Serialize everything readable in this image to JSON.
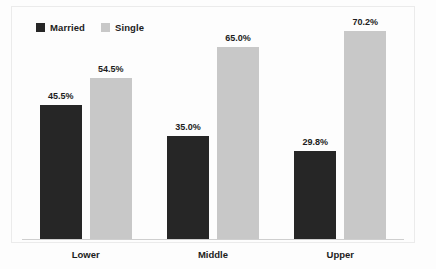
{
  "chart_data": {
    "type": "bar",
    "title": "",
    "subtitle": "",
    "xlabel": "",
    "ylabel": "",
    "categories": [
      "Lower",
      "Middle",
      "Upper"
    ],
    "series": [
      {
        "name": "Married",
        "color": "#262626",
        "values": [
          45.5,
          35.0,
          29.8
        ],
        "labels": [
          "45.5%",
          "54.5%",
          "29.8%"
        ]
      },
      {
        "name": "Single",
        "color": "#c8c8c8",
        "values": [
          54.5,
          65.0,
          70.2
        ],
        "labels": [
          "54.5%",
          "65.0%",
          "70.2%"
        ]
      }
    ],
    "data_labels": {
      "Lower": {
        "Married": "45.5%",
        "Single": "54.5%"
      },
      "Middle": {
        "Married": "35.0%",
        "Single": "65.0%"
      },
      "Upper": {
        "Married": "29.8%",
        "Single": "70.2%"
      }
    },
    "ylim": [
      0,
      76
    ],
    "grid": false,
    "legend_position": "top-left",
    "value_suffix": "%"
  },
  "legend": {
    "items": [
      {
        "label": "Married",
        "color": "#262626"
      },
      {
        "label": "Single",
        "color": "#c8c8c8"
      }
    ]
  },
  "axis": {
    "categories": [
      "Lower",
      "Middle",
      "Upper"
    ]
  },
  "colors": {
    "married": "#262626",
    "single": "#c8c8c8",
    "text": "#1c1c1c",
    "axis": "#cfcfcf",
    "frame": "#ebebeb",
    "background": "#fdfdfd"
  }
}
